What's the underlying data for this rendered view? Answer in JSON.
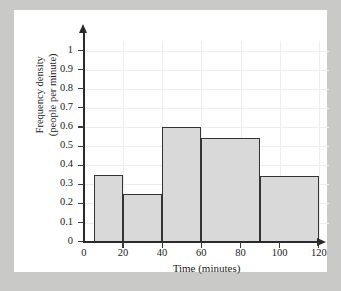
{
  "chart_data": {
    "type": "bar",
    "title": "",
    "xlabel": "Time (minutes)",
    "ylabel_line1": "Frequency density",
    "ylabel_line2": "(people per minute)",
    "xlim": [
      0,
      120
    ],
    "ylim": [
      0,
      1.05
    ],
    "grid": true,
    "legend": "none",
    "xticks": [
      "0",
      "20",
      "40",
      "60",
      "80",
      "100",
      "120"
    ],
    "xtick_values": [
      0,
      20,
      40,
      60,
      80,
      100,
      120
    ],
    "yticks": [
      "0",
      "0.1",
      "0.2",
      "0.3",
      "0.4",
      "0.5",
      "0.6",
      "0.7",
      "0.8",
      "0.9",
      "1"
    ],
    "ytick_values": [
      0,
      0.1,
      0.2,
      0.3,
      0.4,
      0.5,
      0.6,
      0.7,
      0.8,
      0.9,
      1.0
    ],
    "bins": [
      {
        "start": 5,
        "end": 20,
        "value": 0.35
      },
      {
        "start": 20,
        "end": 40,
        "value": 0.25
      },
      {
        "start": 40,
        "end": 60,
        "value": 0.6
      },
      {
        "start": 60,
        "end": 90,
        "value": 0.545
      },
      {
        "start": 90,
        "end": 120,
        "value": 0.345
      }
    ],
    "bar_fill_color": "#d9d9d9",
    "bar_edge_color": "#343434",
    "grid_color": "#ededed",
    "axis_color": "#2a2a2a",
    "background_color": "#ffffff"
  }
}
